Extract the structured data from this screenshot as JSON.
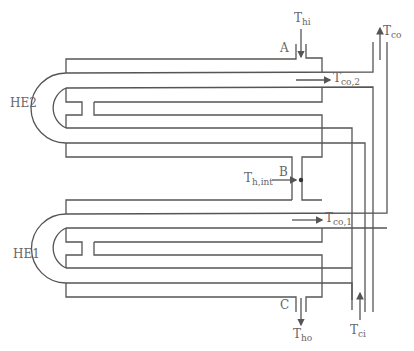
{
  "labels": {
    "he2": "HE2",
    "he1": "HE1",
    "point_a": "A",
    "point_b": "B",
    "point_c": "C",
    "t_hi": {
      "main": "T",
      "sub": "hi"
    },
    "t_co": {
      "main": "T",
      "sub": "co"
    },
    "t_co2": {
      "main": "T",
      "sub": "co,2"
    },
    "t_hint": {
      "main": "T",
      "sub": "h,int"
    },
    "t_co1": {
      "main": "T",
      "sub": "co,1"
    },
    "t_ho": {
      "main": "T",
      "sub": "ho"
    },
    "t_ci": {
      "main": "T",
      "sub": "ci"
    }
  },
  "colors": {
    "line": "#555555",
    "text": "#666666",
    "background": "#ffffff"
  }
}
